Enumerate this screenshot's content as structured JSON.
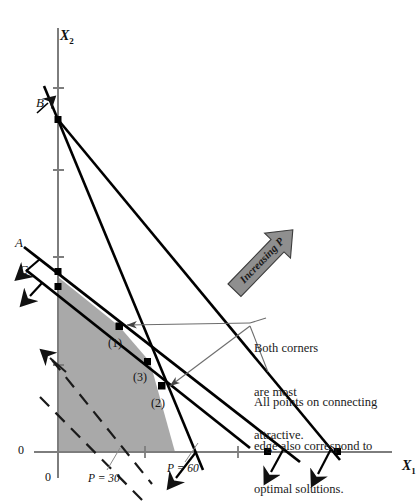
{
  "figure": {
    "type": "linear-programming-graph",
    "background": "#ffffff",
    "feasible_region_color": "#a9a9a9",
    "line_color": "#000000",
    "axis_color": "#7d7d7d",
    "arrow_fill": "#8f8f8f"
  },
  "axes": {
    "x_label": "X",
    "x_label_sub": "1",
    "y_label": "X",
    "y_label_sub": "2",
    "origin_label_y": "0",
    "origin_label_x": "0"
  },
  "constraints": [
    {
      "id": "A",
      "label": "A"
    },
    {
      "id": "B",
      "label": "B"
    },
    {
      "id": "C",
      "label": "C"
    }
  ],
  "corner_points": [
    {
      "id": "1",
      "label": "(1)"
    },
    {
      "id": "3",
      "label": "(3)"
    },
    {
      "id": "2",
      "label": "(2)"
    }
  ],
  "objective_lines": [
    {
      "label": "P",
      "eq": "= 30",
      "text": "P = 30",
      "style": "dashed"
    },
    {
      "label": "P",
      "eq": "= 60",
      "text": "P = 60",
      "style": "dashed"
    }
  ],
  "direction_arrow": {
    "text": "Increasing P",
    "direction": "up-right"
  },
  "annotations": [
    {
      "id": "both-corners",
      "lines": [
        "Both corners",
        "are most",
        "attractive."
      ]
    },
    {
      "id": "connecting-edge",
      "lines": [
        "All points on connecting",
        "edge also correspond to",
        "optimal solutions."
      ]
    }
  ]
}
